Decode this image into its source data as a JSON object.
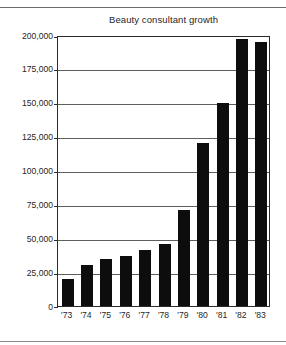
{
  "figure": {
    "title": "Beauty consultant growth"
  },
  "chart_data": {
    "type": "bar",
    "title": "Beauty consultant growth",
    "xlabel": "",
    "ylabel": "",
    "categories": [
      "'73",
      "'74",
      "'75",
      "'76",
      "'77",
      "'78",
      "'79",
      "'80",
      "'81",
      "'82",
      "'83"
    ],
    "values": [
      20000,
      30000,
      35000,
      37000,
      41000,
      46000,
      71000,
      120000,
      150000,
      197000,
      195000
    ],
    "ylim": [
      0,
      200000
    ],
    "ytick_values": [
      0,
      25000,
      50000,
      75000,
      100000,
      125000,
      150000,
      175000,
      200000
    ],
    "ytick_labels": [
      "0",
      "25,000",
      "50,000",
      "75,000",
      "100,000",
      "125,000",
      "150,000",
      "175,000",
      "200,000"
    ],
    "grid": true,
    "legend": false,
    "bar_color": "#0d0d0d",
    "frame_color": "#2b2b2b",
    "background": "#ffffff"
  }
}
